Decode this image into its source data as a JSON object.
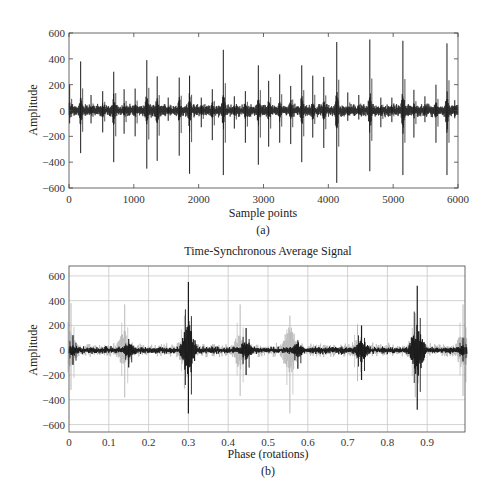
{
  "chart_data": [
    {
      "id": "a",
      "type": "line",
      "title": "",
      "caption": "(a)",
      "xlabel": "Sample points",
      "ylabel": "Amplitude",
      "xlim": [
        0,
        6000
      ],
      "ylim": [
        -600,
        600
      ],
      "xticks": [
        0,
        1000,
        2000,
        3000,
        4000,
        5000,
        6000
      ],
      "yticks": [
        -600,
        -400,
        -200,
        0,
        200,
        400,
        600
      ],
      "grid": false,
      "noise_amplitude": 40,
      "spikes": [
        {
          "x": 10,
          "max": 200,
          "min": -100
        },
        {
          "x": 180,
          "max": 380,
          "min": -330
        },
        {
          "x": 340,
          "max": 120,
          "min": -100
        },
        {
          "x": 520,
          "max": 150,
          "min": -170
        },
        {
          "x": 690,
          "max": 300,
          "min": -400
        },
        {
          "x": 850,
          "max": 165,
          "min": -180
        },
        {
          "x": 1020,
          "max": 170,
          "min": -200
        },
        {
          "x": 1200,
          "max": 390,
          "min": -450
        },
        {
          "x": 1360,
          "max": 265,
          "min": -390
        },
        {
          "x": 1530,
          "max": 100,
          "min": -80
        },
        {
          "x": 1700,
          "max": 255,
          "min": -350
        },
        {
          "x": 1860,
          "max": 270,
          "min": -490
        },
        {
          "x": 2040,
          "max": 100,
          "min": -130
        },
        {
          "x": 2210,
          "max": 165,
          "min": -230
        },
        {
          "x": 2380,
          "max": 470,
          "min": -500
        },
        {
          "x": 2550,
          "max": 110,
          "min": -140
        },
        {
          "x": 2720,
          "max": 150,
          "min": -250
        },
        {
          "x": 2920,
          "max": 350,
          "min": -420
        },
        {
          "x": 3080,
          "max": 230,
          "min": -280
        },
        {
          "x": 3250,
          "max": 280,
          "min": -250
        },
        {
          "x": 3420,
          "max": 190,
          "min": -260
        },
        {
          "x": 3590,
          "max": 350,
          "min": -400
        },
        {
          "x": 3760,
          "max": 270,
          "min": -210
        },
        {
          "x": 3930,
          "max": 260,
          "min": -290
        },
        {
          "x": 4130,
          "max": 530,
          "min": -560
        },
        {
          "x": 4300,
          "max": 140,
          "min": -80
        },
        {
          "x": 4470,
          "max": 120,
          "min": -70
        },
        {
          "x": 4640,
          "max": 550,
          "min": -470
        },
        {
          "x": 4810,
          "max": 100,
          "min": -130
        },
        {
          "x": 4980,
          "max": 100,
          "min": -90
        },
        {
          "x": 5150,
          "max": 540,
          "min": -500
        },
        {
          "x": 5320,
          "max": 160,
          "min": -210
        },
        {
          "x": 5490,
          "max": 110,
          "min": -90
        },
        {
          "x": 5660,
          "max": 200,
          "min": -250
        },
        {
          "x": 5830,
          "max": 520,
          "min": -500
        },
        {
          "x": 5950,
          "max": 80,
          "min": -60
        }
      ]
    },
    {
      "id": "b",
      "type": "line",
      "title": "Time-Synchronous Average Signal",
      "caption": "(b)",
      "xlabel": "Phase (rotations)",
      "ylabel": "Amplitude",
      "xlim": [
        0,
        1.0
      ],
      "ylim": [
        -660,
        680
      ],
      "xticks": [
        0,
        0.1,
        0.2,
        0.3,
        0.4,
        0.5,
        0.6,
        0.7,
        0.8,
        0.9
      ],
      "xtick_labels": [
        "0",
        "0.1",
        "0.2",
        "0.3",
        "0.4",
        "0.5",
        "0.6",
        "0.7",
        "0.8",
        "0.9"
      ],
      "yticks": [
        -600,
        -400,
        -200,
        0,
        200,
        400,
        600
      ],
      "grid": true,
      "series": [
        {
          "name": "individual rotations",
          "color": "#b8b8b8",
          "bursts": [
            {
              "x": 0.005,
              "max": 380,
              "min": -320
            },
            {
              "x": 0.14,
              "max": 370,
              "min": -380
            },
            {
              "x": 0.29,
              "max": 280,
              "min": -310
            },
            {
              "x": 0.43,
              "max": 370,
              "min": -370
            },
            {
              "x": 0.555,
              "max": 280,
              "min": -510
            },
            {
              "x": 0.725,
              "max": 210,
              "min": -250
            },
            {
              "x": 0.87,
              "max": 300,
              "min": -380
            },
            {
              "x": 0.99,
              "max": 370,
              "min": -370
            }
          ]
        },
        {
          "name": "average",
          "color": "#1a1a1a",
          "bursts": [
            {
              "x": 0.01,
              "max": 120,
              "min": -120
            },
            {
              "x": 0.15,
              "max": 90,
              "min": -140
            },
            {
              "x": 0.3,
              "max": 550,
              "min": -510
            },
            {
              "x": 0.445,
              "max": 180,
              "min": -200
            },
            {
              "x": 0.575,
              "max": 80,
              "min": -150
            },
            {
              "x": 0.735,
              "max": 200,
              "min": -240
            },
            {
              "x": 0.875,
              "max": 520,
              "min": -480
            },
            {
              "x": 0.99,
              "max": 100,
              "min": -90
            }
          ]
        }
      ]
    }
  ]
}
